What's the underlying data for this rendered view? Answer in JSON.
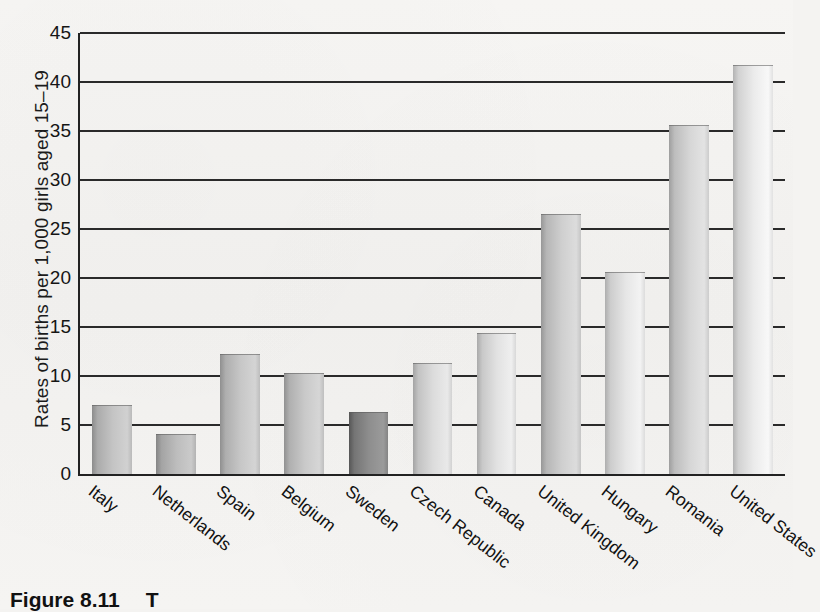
{
  "chart_data": {
    "type": "bar",
    "title": "",
    "xlabel": "",
    "ylabel": "Rates of births per 1,000 girls aged 15–19",
    "ylim": [
      0,
      45
    ],
    "yticks": [
      0,
      5,
      10,
      15,
      20,
      25,
      30,
      35,
      40,
      45
    ],
    "grid": true,
    "legend": "none",
    "categories": [
      "Italy",
      "Netherlands",
      "Spain",
      "Belgium",
      "Sweden",
      "Czech Republic",
      "Canada",
      "United Kingdom",
      "Hungary",
      "Romania",
      "United States"
    ],
    "values": [
      6.9,
      4.0,
      12.1,
      10.2,
      6.2,
      11.2,
      14.3,
      26.4,
      20.5,
      35.5,
      41.6
    ],
    "bar_shades": [
      "#c4c4c4",
      "#bdbdbd",
      "#c7c7c7",
      "#c9c9c9",
      "#8e8e8e",
      "#dcdcdc",
      "#e2e2e2",
      "#cfcfcf",
      "#e6e6e6",
      "#d6d6d6",
      "#ebebeb"
    ]
  },
  "caption": {
    "figure_number": "Figure 8.11",
    "text": "T"
  },
  "colors": {
    "axis": "#222222",
    "grid": "#2a2a2a",
    "text": "#111111",
    "background": "#f4f3f1"
  }
}
